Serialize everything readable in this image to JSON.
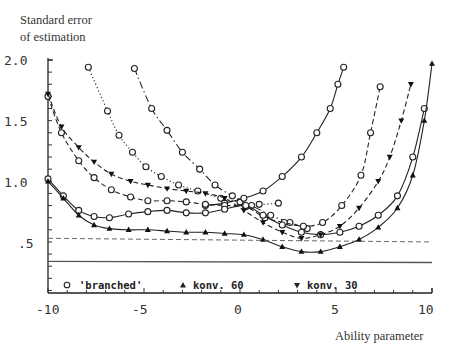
{
  "chart_data": {
    "type": "line",
    "title": "",
    "ylabel": "Standard error of estimation",
    "xlabel": "Ability parameter",
    "xlim": [
      -10,
      10
    ],
    "ylim": [
      0.08,
      2.0
    ],
    "x_ticks": [
      "-10",
      "-5",
      "0",
      "5",
      "10"
    ],
    "y_ticks": [
      ".5",
      "1.0",
      "1.5",
      "2.0"
    ],
    "grid": false,
    "legend_position": "bottom-inside",
    "legend": [
      {
        "marker": "open-circle",
        "label": "'branched'"
      },
      {
        "marker": "filled-triangle-up",
        "label": "konv. 60"
      },
      {
        "marker": "filled-triangle-down",
        "label": "konv. 30"
      }
    ],
    "series": [
      {
        "name": "'branched' (dotted, shifted left)",
        "marker": "open-circle",
        "style": "dotted",
        "x": [
          -7.9,
          -6.9,
          -6.3,
          -5.6,
          -4.9,
          -4.1,
          -3.2,
          -2.2,
          -1.0,
          0.0,
          1.0,
          2.0
        ],
        "y": [
          1.94,
          1.58,
          1.38,
          1.24,
          1.12,
          1.04,
          0.97,
          0.92,
          0.86,
          0.83,
          0.81,
          0.82
        ]
      },
      {
        "name": "'branched' (dash-dot, shifted left)",
        "marker": "open-circle",
        "style": "dashdot",
        "x": [
          -5.5,
          -4.6,
          -3.8,
          -3.0,
          -2.1,
          -1.3,
          -0.4,
          0.6,
          1.6,
          2.6,
          3.5
        ],
        "y": [
          1.93,
          1.6,
          1.42,
          1.24,
          1.1,
          0.97,
          0.88,
          0.8,
          0.72,
          0.66,
          0.61
        ]
      },
      {
        "name": "'branched' (solid, U-curve)",
        "marker": "open-circle",
        "style": "solid",
        "x": [
          -1.8,
          -0.8,
          0.2,
          1.2,
          2.2,
          3.2,
          4.0,
          4.7,
          5.1,
          5.4
        ],
        "y": [
          0.8,
          0.82,
          0.86,
          0.92,
          1.04,
          1.2,
          1.4,
          1.6,
          1.8,
          1.94
        ]
      },
      {
        "name": "'branched' (dashed, mid-high)",
        "marker": "open-circle",
        "style": "dashed",
        "x": [
          -10,
          -9.3,
          -8.4,
          -7.6,
          -6.7,
          -5.7,
          -4.8,
          -3.8,
          -2.8,
          -1.8,
          -0.8,
          0.3,
          1.3,
          2.3,
          3.3,
          4.3,
          5.3,
          6.3,
          6.8,
          7.3
        ],
        "y": [
          1.7,
          1.4,
          1.17,
          1.03,
          0.93,
          0.87,
          0.84,
          0.84,
          0.83,
          0.81,
          0.8,
          0.79,
          0.7,
          0.66,
          0.63,
          0.66,
          0.8,
          1.05,
          1.4,
          1.78
        ]
      },
      {
        "name": "'branched' (solid, low)",
        "marker": "open-circle",
        "style": "solid",
        "x": [
          -10,
          -9.2,
          -8.4,
          -7.6,
          -6.8,
          -5.8,
          -4.8,
          -3.8,
          -2.8,
          -1.8,
          -0.8,
          0.3,
          1.2,
          2.2,
          3.2,
          4.2,
          5.2,
          6.2,
          7.2,
          8.2,
          9.0,
          9.6
        ],
        "y": [
          1.02,
          0.88,
          0.76,
          0.71,
          0.7,
          0.73,
          0.75,
          0.76,
          0.74,
          0.74,
          0.77,
          0.8,
          0.72,
          0.64,
          0.58,
          0.56,
          0.58,
          0.63,
          0.72,
          0.88,
          1.2,
          1.6
        ]
      },
      {
        "name": "konv. 60",
        "marker": "filled-triangle-up",
        "style": "solid",
        "x": [
          -10,
          -9.2,
          -8.4,
          -7.6,
          -6.8,
          -5.8,
          -4.8,
          -3.8,
          -2.8,
          -1.8,
          -0.8,
          0.2,
          1.2,
          2.2,
          3.2,
          4.2,
          5.2,
          6.2,
          7.2,
          8.2,
          9.0,
          9.6,
          10.0
        ],
        "y": [
          1.0,
          0.86,
          0.72,
          0.64,
          0.61,
          0.6,
          0.6,
          0.59,
          0.58,
          0.58,
          0.57,
          0.56,
          0.52,
          0.46,
          0.42,
          0.42,
          0.46,
          0.52,
          0.62,
          0.78,
          1.05,
          1.5,
          1.97
        ]
      },
      {
        "name": "konv. 30",
        "marker": "filled-triangle-down",
        "style": "dashed",
        "x": [
          -10,
          -9.3,
          -8.4,
          -7.6,
          -6.7,
          -5.7,
          -4.8,
          -3.8,
          -2.8,
          -1.8,
          -0.8,
          0.2,
          1.2,
          2.2,
          3.2,
          4.2,
          5.2,
          6.2,
          7.2,
          7.8,
          8.4,
          8.9
        ],
        "y": [
          1.72,
          1.45,
          1.28,
          1.16,
          1.06,
          1.0,
          0.97,
          0.94,
          0.92,
          0.9,
          0.86,
          0.76,
          0.66,
          0.58,
          0.53,
          0.56,
          0.63,
          0.78,
          1.0,
          1.2,
          1.5,
          1.8
        ]
      },
      {
        "name": "reference (dashed horizontal)",
        "marker": "none",
        "style": "dashed",
        "x": [
          -10,
          10
        ],
        "y": [
          0.53,
          0.5
        ]
      },
      {
        "name": "reference (solid horizontal)",
        "marker": "none",
        "style": "solid",
        "x": [
          -10,
          10
        ],
        "y": [
          0.34,
          0.33
        ]
      }
    ]
  },
  "labels": {
    "ylabel_line1": "Standard error",
    "ylabel_line2": "of estimation",
    "xlabel": "Ability parameter",
    "yticks": {
      "t20": "2.0",
      "t15": "1.5",
      "t10": "1.0",
      "t05": ".5"
    },
    "xticks": {
      "m10": "-10",
      "m5": "-5",
      "z": "0",
      "p5": "5",
      "p10": "10"
    },
    "legend": {
      "branched": "'branched'",
      "konv60": "konv. 60",
      "konv30": "konv. 30"
    }
  }
}
